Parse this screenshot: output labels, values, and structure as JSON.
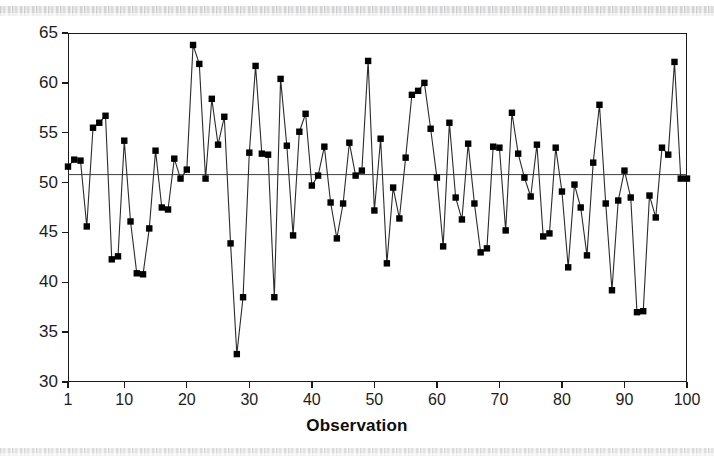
{
  "figure": {
    "axis_title": "Observation",
    "marker_color": "#000000",
    "line_color": "#2b2b2b",
    "frame_color": "#1a1a1a",
    "background": "#ffffff"
  },
  "chart_data": {
    "type": "line",
    "title": "",
    "subtitle": "",
    "xlabel": "Observation",
    "ylabel": "",
    "xlim": [
      1,
      100
    ],
    "ylim": [
      30,
      65
    ],
    "grid": false,
    "legend": null,
    "marker": "filled-square",
    "xticks": [
      1,
      10,
      20,
      30,
      40,
      50,
      60,
      70,
      80,
      90,
      100
    ],
    "xtick_labels": [
      "1",
      "10",
      "20",
      "30",
      "40",
      "50",
      "60",
      "70",
      "80",
      "90",
      "100"
    ],
    "yticks": [
      30,
      35,
      40,
      45,
      50,
      55,
      60,
      65
    ],
    "ytick_labels": [
      "30",
      "35",
      "40",
      "45",
      "50",
      "55",
      "60",
      "65"
    ],
    "annotations": [
      {
        "type": "hline",
        "value": 50.8,
        "label": "center line"
      }
    ],
    "x": [
      1,
      2,
      3,
      4,
      5,
      6,
      7,
      8,
      9,
      10,
      11,
      12,
      13,
      14,
      15,
      16,
      17,
      18,
      19,
      20,
      21,
      22,
      23,
      24,
      25,
      26,
      27,
      28,
      29,
      30,
      31,
      32,
      33,
      34,
      35,
      36,
      37,
      38,
      39,
      40,
      41,
      42,
      43,
      44,
      45,
      46,
      47,
      48,
      49,
      50,
      51,
      52,
      53,
      54,
      55,
      56,
      57,
      58,
      59,
      60,
      61,
      62,
      63,
      64,
      65,
      66,
      67,
      68,
      69,
      70,
      71,
      72,
      73,
      74,
      75,
      76,
      77,
      78,
      79,
      80,
      81,
      82,
      83,
      84,
      85,
      86,
      87,
      88,
      89,
      90,
      91,
      92,
      93,
      94,
      95,
      96,
      97,
      98,
      99,
      100
    ],
    "values": [
      51.6,
      52.3,
      52.2,
      45.6,
      55.5,
      56.0,
      56.7,
      42.3,
      42.6,
      54.2,
      46.1,
      40.9,
      40.8,
      45.4,
      53.2,
      47.5,
      47.3,
      52.4,
      50.4,
      51.3,
      63.8,
      61.9,
      50.4,
      58.4,
      53.8,
      56.6,
      43.9,
      32.8,
      38.5,
      53.0,
      61.7,
      52.9,
      52.8,
      38.5,
      60.4,
      53.7,
      44.7,
      55.1,
      56.9,
      49.7,
      50.7,
      53.6,
      48.0,
      44.4,
      47.9,
      54.0,
      50.7,
      51.2,
      62.2,
      47.2,
      54.4,
      41.9,
      49.5,
      46.4,
      52.5,
      58.8,
      59.2,
      60.0,
      55.4,
      50.5,
      43.6,
      56.0,
      48.5,
      46.3,
      53.9,
      47.9,
      43.0,
      43.4,
      53.6,
      53.5,
      45.2,
      57.0,
      52.9,
      50.5,
      48.6,
      53.8,
      44.6,
      44.9,
      53.5,
      49.1,
      41.5,
      49.8,
      47.5,
      42.7,
      52.0,
      57.8,
      47.9,
      39.2,
      48.2,
      51.2,
      48.5,
      37.0,
      37.1,
      48.7,
      46.5,
      53.5,
      52.8,
      62.1,
      50.4,
      50.4
    ]
  }
}
